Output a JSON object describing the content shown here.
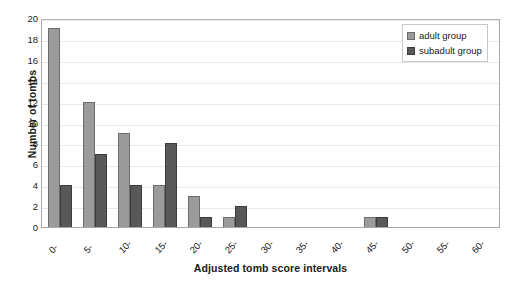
{
  "chart_data": {
    "type": "bar",
    "title": "",
    "xlabel": "Adjusted tomb score intervals",
    "ylabel": "Number of tombs",
    "categories": [
      "0-",
      "5-",
      "10-",
      "15-",
      "20-",
      "25-",
      "30-",
      "35-",
      "40-",
      "45-",
      "50-",
      "55-",
      "60-"
    ],
    "series": [
      {
        "name": "adult group",
        "color": "#9b9b9b",
        "values": [
          19,
          12,
          9,
          4,
          3,
          1,
          0,
          0,
          0,
          1,
          0,
          0,
          0
        ]
      },
      {
        "name": "subadult group",
        "color": "#585858",
        "values": [
          4,
          7,
          4,
          8,
          1,
          2,
          0,
          0,
          0,
          1,
          0,
          0,
          0
        ]
      }
    ],
    "ylim": [
      0,
      20
    ],
    "ytick_step": 2,
    "yticks": [
      0,
      2,
      4,
      6,
      8,
      10,
      12,
      14,
      16,
      18,
      20
    ],
    "grid": "horizontal",
    "legend_position": "top-right",
    "xtick_rotation": -45
  },
  "legend": {
    "entries": [
      {
        "label": "adult group"
      },
      {
        "label": "subadult group"
      }
    ]
  }
}
